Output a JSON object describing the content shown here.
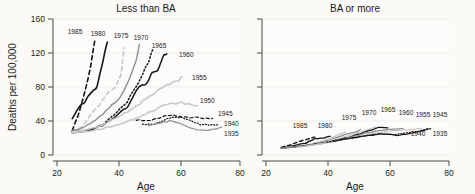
{
  "figure": {
    "background": "#fbfaf7",
    "width": 475,
    "height": 194
  },
  "axis": {
    "y_label": "Deaths per 100,000",
    "x_label_left": "Age",
    "x_label_right": "Age",
    "y_ticks": [
      "0",
      "40",
      "80",
      "120",
      "160"
    ],
    "x_ticks": [
      "20",
      "40",
      "60",
      "80"
    ],
    "ylim": [
      0,
      160
    ],
    "xlim": [
      20,
      80
    ]
  },
  "panels": {
    "left_title": "Less than BA",
    "right_title": "BA or more"
  },
  "colors": {
    "black": "#161616",
    "dark_gray": "#6d6d6d",
    "light_gray": "#c8c8c8",
    "spine": "#4a4a4a",
    "grid": "#eceae4",
    "text": "#1a1a1a"
  },
  "chart_data": {
    "type": "line",
    "xlabel": "Age",
    "ylabel": "Deaths per 100,000",
    "xlim": [
      20,
      80
    ],
    "ylim": [
      0,
      160
    ],
    "x_ticks": [
      20,
      40,
      60,
      80
    ],
    "y_ticks": [
      0,
      40,
      80,
      120,
      160
    ],
    "grid": "light horizontal gridlines",
    "legend": "inline end-of-line cohort year labels",
    "panels": [
      {
        "name": "Less than BA",
        "series": [
          {
            "name": "1985",
            "label": "1985",
            "color": "#161616",
            "style": "dashed",
            "width": 1.6,
            "x": [
              25,
              27,
              29,
              31,
              32.5
            ],
            "y": [
              29,
              48,
              72,
              104,
              137
            ]
          },
          {
            "name": "1980",
            "label": "1980",
            "color": "#161616",
            "style": "solid",
            "width": 1.6,
            "x": [
              25,
              27,
              29,
              31,
              33,
              35,
              36.5
            ],
            "y": [
              43,
              56,
              62,
              73,
              80,
              110,
              133
            ]
          },
          {
            "name": "1975",
            "label": "1975",
            "color": "#c8c8c8",
            "style": "dashed",
            "width": 1.6,
            "x": [
              25,
              28,
              31,
              34,
              37,
              39,
              41,
              42
            ],
            "y": [
              27,
              33,
              47,
              60,
              74,
              80,
              95,
              126
            ]
          },
          {
            "name": "1970",
            "label": "1970",
            "color": "#8f8f8f",
            "style": "solid",
            "width": 1.4,
            "x": [
              25,
              29,
              33,
              37,
              41,
              44,
              46,
              47
            ],
            "y": [
              28,
              33,
              42,
              55,
              69,
              92,
              112,
              130
            ]
          },
          {
            "name": "1965",
            "label": "1965",
            "color": "#161616",
            "style": "dotted",
            "width": 1.5,
            "x": [
              25,
              30,
              35,
              39,
              43,
              46,
              48,
              50,
              51.5
            ],
            "y": [
              26,
              28,
              36,
              48,
              63,
              80,
              95,
              110,
              125
            ]
          },
          {
            "name": "1960",
            "label": "1960",
            "color": "#161616",
            "style": "solid",
            "width": 1.5,
            "x": [
              25,
              30,
              35,
              39,
              43,
              45,
              47,
              49,
              51,
              53,
              55,
              56
            ],
            "y": [
              27,
              29,
              35,
              45,
              56,
              70,
              81,
              82,
              95,
              100,
              118,
              119
            ]
          },
          {
            "name": "1955",
            "label": "1955",
            "color": "#c8c8c8",
            "style": "solid",
            "width": 1.6,
            "x": [
              25,
              30,
              35,
              40,
              45,
              50,
              54,
              57,
              60,
              61
            ],
            "y": [
              27,
              30,
              35,
              45,
              55,
              68,
              78,
              84,
              88,
              92
            ]
          },
          {
            "name": "1950",
            "label": "1950",
            "color": "#c8c8c8",
            "style": "solid",
            "width": 1.6,
            "x": [
              25,
              30,
              35,
              40,
              45,
              50,
              55,
              60,
              63,
              66
            ],
            "y": [
              26,
              28,
              31,
              36,
              42,
              50,
              58,
              62,
              60,
              58
            ]
          },
          {
            "name": "1945",
            "label": "1945",
            "color": "#161616",
            "style": "dashed",
            "width": 1.2,
            "x": [
              46,
              50,
              54,
              57,
              60,
              63,
              66,
              69,
              71
            ],
            "y": [
              41,
              40,
              44,
              47,
              45,
              44,
              44,
              43,
              43
            ]
          },
          {
            "name": "1940",
            "label": "1940",
            "color": "#161616",
            "style": "dotted",
            "width": 1.2,
            "x": [
              48,
              52,
              55,
              58,
              61,
              64,
              67,
              70,
              73
            ],
            "y": [
              36,
              36,
              41,
              45,
              44,
              40,
              36,
              35,
              36
            ]
          },
          {
            "name": "1935",
            "label": "1935",
            "color": "#8f8f8f",
            "style": "solid",
            "width": 1.2,
            "x": [
              50,
              54,
              57,
              60,
              63,
              66,
              69,
              72,
              74
            ],
            "y": [
              35,
              38,
              40,
              38,
              33,
              30,
              29,
              31,
              33
            ]
          }
        ]
      },
      {
        "name": "BA or more",
        "series": [
          {
            "name": "1985",
            "label": "1985",
            "color": "#161616",
            "style": "dashed",
            "width": 1.4,
            "x": [
              25,
              28,
              31,
              34,
              36
            ],
            "y": [
              9,
              12,
              16,
              19,
              21
            ]
          },
          {
            "name": "1980",
            "label": "1980",
            "color": "#161616",
            "style": "solid",
            "width": 1.4,
            "x": [
              25,
              29,
              33,
              36,
              39,
              41
            ],
            "y": [
              8,
              11,
              14,
              19,
              20,
              22
            ]
          },
          {
            "name": "1975",
            "label": "1975",
            "color": "#c8c8c8",
            "style": "solid",
            "width": 1.4,
            "x": [
              25,
              30,
              35,
              40,
              44,
              46
            ],
            "y": [
              8,
              10,
              13,
              18,
              24,
              27
            ]
          },
          {
            "name": "1970",
            "label": "1970",
            "color": "#8f8f8f",
            "style": "solid",
            "width": 1.3,
            "x": [
              25,
              31,
              37,
              42,
              46,
              50,
              51
            ],
            "y": [
              8,
              10,
              14,
              19,
              24,
              28,
              30
            ]
          },
          {
            "name": "1965",
            "label": "1965",
            "color": "#c8c8c8",
            "style": "solid",
            "width": 1.3,
            "x": [
              25,
              32,
              38,
              44,
              49,
              53,
              56
            ],
            "y": [
              8,
              11,
              14,
              20,
              25,
              29,
              33
            ]
          },
          {
            "name": "1960",
            "label": "1960",
            "color": "#161616",
            "style": "solid",
            "width": 1.3,
            "x": [
              25,
              33,
              40,
              46,
              51,
              55,
              58,
              60
            ],
            "y": [
              8,
              11,
              15,
              20,
              25,
              30,
              33,
              32
            ]
          },
          {
            "name": "1955",
            "label": "1955",
            "color": "#8f8f8f",
            "style": "solid",
            "width": 1.3,
            "x": [
              25,
              34,
              42,
              48,
              53,
              58,
              62,
              65
            ],
            "y": [
              8,
              11,
              16,
              21,
              26,
              29,
              31,
              31
            ]
          },
          {
            "name": "1945",
            "label": "1945",
            "color": "#c8c8c8",
            "style": "solid",
            "width": 1.3,
            "x": [
              30,
              38,
              45,
              52,
              58,
              63,
              68,
              71
            ],
            "y": [
              9,
              13,
              18,
              23,
              27,
              29,
              30,
              31
            ]
          },
          {
            "name": "1940",
            "label": "1940",
            "color": "#161616",
            "style": "dotted",
            "width": 1.2,
            "x": [
              40,
              46,
              52,
              57,
              62,
              66,
              70,
              73
            ],
            "y": [
              15,
              19,
              22,
              25,
              24,
              26,
              28,
              31
            ]
          },
          {
            "name": "1935",
            "label": "1935",
            "color": "#161616",
            "style": "solid",
            "width": 1.2,
            "x": [
              42,
              48,
              54,
              59,
              63,
              67,
              71,
              74
            ],
            "y": [
              16,
              20,
              23,
              25,
              23,
              25,
              28,
              31
            ]
          }
        ]
      }
    ]
  },
  "series_labels_left": [
    "1985",
    "1980",
    "1975",
    "1970",
    "1965",
    "1960",
    "1955",
    "1950",
    "1945",
    "1940",
    "1935"
  ],
  "series_labels_right": [
    "1985",
    "1980",
    "1975",
    "1970",
    "1965",
    "1960",
    "1955",
    "1945",
    "1940",
    "1935"
  ]
}
